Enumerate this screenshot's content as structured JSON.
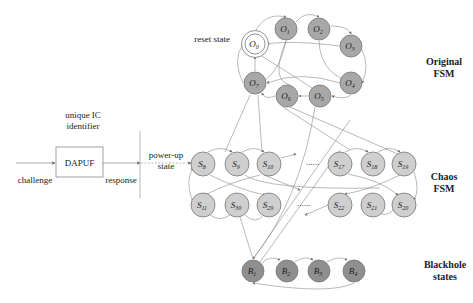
{
  "colors": {
    "original_node": "#a8a8a8",
    "chaos_node": "#cfcfcf",
    "blackhole_node": "#8f8f8f",
    "edge": "#8a8a8a",
    "text": "#222222"
  },
  "left": {
    "identifier_line1": "unique IC",
    "identifier_line2": "identifier",
    "box_label": "DAPUF",
    "challenge": "challenge",
    "response": "response",
    "powerup_line1": "power-up",
    "powerup_line2": "state"
  },
  "labels": {
    "reset_state": "reset state",
    "original_line1": "Original",
    "original_line2": "FSM",
    "chaos_line1": "Chaos",
    "chaos_line2": "FSM",
    "blackhole_line1": "Blackhole",
    "blackhole_line2": "states",
    "ellipsis": "......"
  },
  "original_nodes": [
    {
      "base": "O",
      "sub": "0",
      "x": 255,
      "y": 44
    },
    {
      "base": "O",
      "sub": "1",
      "x": 286,
      "y": 29
    },
    {
      "base": "O",
      "sub": "2",
      "x": 319,
      "y": 29
    },
    {
      "base": "O",
      "sub": "3",
      "x": 351,
      "y": 46
    },
    {
      "base": "O",
      "sub": "4",
      "x": 351,
      "y": 83
    },
    {
      "base": "O",
      "sub": "5",
      "x": 320,
      "y": 96
    },
    {
      "base": "O",
      "sub": "6",
      "x": 287,
      "y": 96
    },
    {
      "base": "O",
      "sub": "7",
      "x": 255,
      "y": 83
    }
  ],
  "chaos_nodes": [
    {
      "base": "S",
      "sub": "8",
      "x": 203,
      "y": 164
    },
    {
      "base": "S",
      "sub": "9",
      "x": 237,
      "y": 164
    },
    {
      "base": "S",
      "sub": "10",
      "x": 269,
      "y": 164
    },
    {
      "base": "S",
      "sub": "17",
      "x": 340,
      "y": 164
    },
    {
      "base": "S",
      "sub": "18",
      "x": 373,
      "y": 164
    },
    {
      "base": "S",
      "sub": "19",
      "x": 404,
      "y": 164
    },
    {
      "base": "S",
      "sub": "11",
      "x": 203,
      "y": 205
    },
    {
      "base": "S",
      "sub": "30",
      "x": 237,
      "y": 205
    },
    {
      "base": "S",
      "sub": "29",
      "x": 269,
      "y": 205
    },
    {
      "base": "S",
      "sub": "22",
      "x": 340,
      "y": 205
    },
    {
      "base": "S",
      "sub": "21",
      "x": 373,
      "y": 205
    },
    {
      "base": "S",
      "sub": "20",
      "x": 404,
      "y": 205
    }
  ],
  "blackhole_nodes": [
    {
      "base": "B",
      "sub": "1",
      "x": 253,
      "y": 271
    },
    {
      "base": "B",
      "sub": "2",
      "x": 287,
      "y": 271
    },
    {
      "base": "B",
      "sub": "3",
      "x": 319,
      "y": 271
    },
    {
      "base": "B",
      "sub": "4",
      "x": 354,
      "y": 271
    }
  ]
}
